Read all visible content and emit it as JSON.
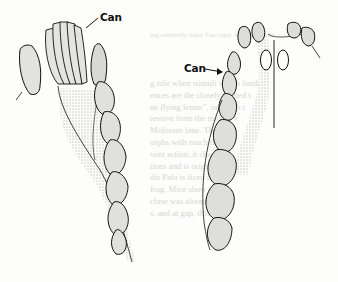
{
  "figure": {
    "left_view": {
      "description": "lower jaw (mandible) dentition, occlusal view",
      "label": "Can"
    },
    "right_view": {
      "description": "upper jaw (maxilla) dentition, occlusal view",
      "label": "Can"
    }
  },
  "bleed_through": {
    "top_lines": [
      "ing relatively hairy Fau",
      "ragal. Moderate sele"
    ],
    "body_lines": [
      "g role when stimuli which funda",
      "ences are the closely related t",
      "ne flying lemur\", in which t",
      "ressive from the middle v",
      "Molossus lane. The most",
      "orphs with much the low",
      "vent action, it characte",
      "tions and is original",
      "dis Pafa is ficed in the",
      "frog. Mice show an the",
      "cluse was already in",
      "s, and at gap, this this,"
    ]
  }
}
